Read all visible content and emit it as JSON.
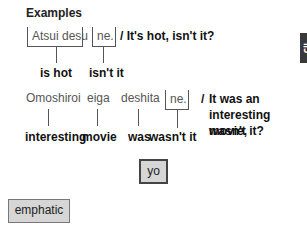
{
  "heading": "Examples",
  "example1": {
    "words": [
      {
        "jp": "Atsui desu",
        "en": "is hot"
      },
      {
        "jp": "ne.",
        "en": "isn't it"
      }
    ],
    "translation": "/ It's hot, isn't it?"
  },
  "example2": {
    "words": [
      {
        "jp": "Omoshiroi",
        "en": "interesting"
      },
      {
        "jp": "eiga",
        "en": "movie"
      },
      {
        "jp": "deshita",
        "en": "was"
      },
      {
        "jp": "ne.",
        "en": "wasn't it"
      }
    ],
    "translation_slash": "/",
    "translation_lines": [
      "It was an",
      "interesting movie,",
      "wasn't it?"
    ]
  },
  "particles": [
    {
      "label": "yo"
    },
    {
      "label": "emphatic"
    }
  ],
  "side_tab": {
    "label": "き"
  }
}
